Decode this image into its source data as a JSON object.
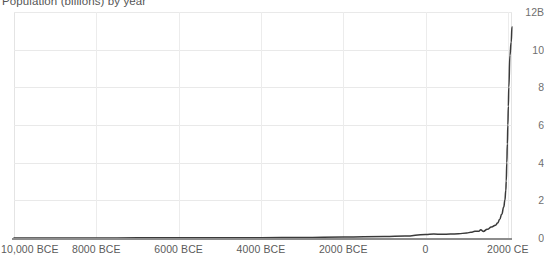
{
  "chart_data": {
    "type": "line",
    "title": "Population (billions) by year",
    "xlabel": "",
    "ylabel": "",
    "ylim": [
      0,
      12
    ],
    "xlim": [
      -10000,
      2100
    ],
    "grid": true,
    "legend": false,
    "y_axis_position": "right",
    "y_ticks": [
      {
        "value": 12,
        "label": "12B"
      },
      {
        "value": 10,
        "label": "10"
      },
      {
        "value": 8,
        "label": "8"
      },
      {
        "value": 6,
        "label": "6"
      },
      {
        "value": 4,
        "label": "4"
      },
      {
        "value": 2,
        "label": "2"
      },
      {
        "value": 0,
        "label": "0"
      }
    ],
    "x_ticks": [
      {
        "value": -10000,
        "label": "10,000 BCE"
      },
      {
        "value": -8000,
        "label": "8000 BCE"
      },
      {
        "value": -6000,
        "label": "6000 BCE"
      },
      {
        "value": -4000,
        "label": "4000 BCE"
      },
      {
        "value": -2000,
        "label": "2000 BCE"
      },
      {
        "value": 0,
        "label": "0"
      },
      {
        "value": 2000,
        "label": "2000 CE"
      }
    ],
    "series": [
      {
        "name": "Population",
        "color": "#3a3a3a",
        "x": [
          -10000,
          -9000,
          -8000,
          -7000,
          -6000,
          -5000,
          -4000,
          -3000,
          -2000,
          -1000,
          -500,
          0,
          200,
          400,
          600,
          800,
          1000,
          1100,
          1200,
          1300,
          1340,
          1400,
          1500,
          1600,
          1700,
          1750,
          1800,
          1850,
          1900,
          1927,
          1950,
          1960,
          1974,
          1987,
          1999,
          2011,
          2022,
          2050,
          2080,
          2100
        ],
        "y": [
          0.004,
          0.005,
          0.006,
          0.007,
          0.008,
          0.012,
          0.018,
          0.03,
          0.05,
          0.075,
          0.1,
          0.19,
          0.21,
          0.2,
          0.21,
          0.22,
          0.27,
          0.3,
          0.36,
          0.36,
          0.44,
          0.35,
          0.46,
          0.58,
          0.68,
          0.79,
          0.98,
          1.26,
          1.65,
          2.0,
          2.54,
          3.03,
          4.0,
          5.0,
          6.0,
          7.0,
          8.0,
          9.7,
          10.4,
          11.2
        ]
      }
    ]
  },
  "colors": {
    "line": "#3a3a3a",
    "gridline": "#e9e9e9",
    "baseline": "#8d8d8d",
    "title_text": "#555555",
    "tick_text": "#5b5b5b",
    "background": "#ffffff"
  }
}
